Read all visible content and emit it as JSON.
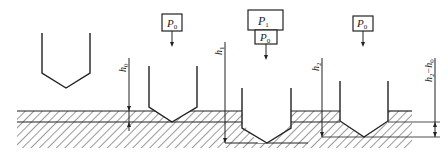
{
  "diagram": {
    "stages": [
      {
        "id": "initial",
        "load_labels": []
      },
      {
        "id": "preload",
        "load_labels": [
          "P",
          "0"
        ],
        "depth_label": {
          "main": "h",
          "sub": "0"
        }
      },
      {
        "id": "main_load",
        "load_labels_top": [
          "P",
          "1"
        ],
        "load_labels_bottom": [
          "P",
          "0"
        ],
        "depth_label": {
          "main": "h",
          "sub": "1"
        }
      },
      {
        "id": "unloaded",
        "load_labels": [
          "P",
          "0"
        ],
        "depth_label": {
          "main": "h",
          "sub": "2"
        }
      }
    ],
    "difference_label": {
      "main1": "h",
      "sub1": "2",
      "dash": "−",
      "main2": "h",
      "sub2": "0"
    },
    "colors": {
      "line": "#222222",
      "background": "#ffffff"
    }
  }
}
